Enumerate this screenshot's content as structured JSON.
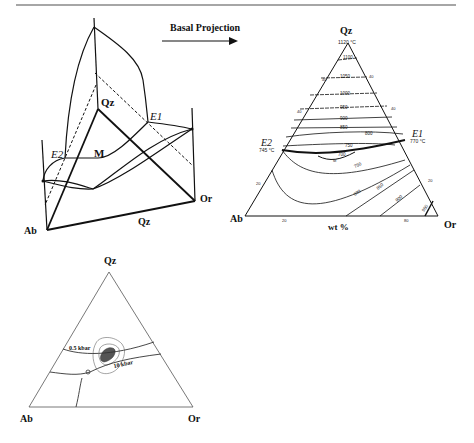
{
  "figure": {
    "top_rule": true,
    "block_diagram": {
      "labels": {
        "apex": "Qz",
        "left_corner": "Ab",
        "right_corner": "Or",
        "base_edge": "Qz",
        "eutectic_left": "E2",
        "eutectic_right": "E1",
        "minimum": "M"
      }
    },
    "arrow": {
      "label": "Basal Projection"
    },
    "projection": {
      "labels": {
        "apex": "Qz",
        "left_corner": "Ab",
        "right_corner": "Or",
        "axis": "wt %",
        "apex_temp": "1120 °C",
        "e2": "E2",
        "e2_temp": "745 °C",
        "e1": "E1",
        "e1_temp": "770 °C",
        "minimum": "M"
      },
      "isotherms": [
        "1100",
        "1050",
        "1000",
        "950",
        "900",
        "850",
        "800",
        "750",
        "700",
        "750",
        "800",
        "850",
        "900",
        "950"
      ],
      "edge_ticks": {
        "left_edge": [
          "40",
          "40",
          "20"
        ],
        "right_edge": [
          "40",
          "40",
          "20"
        ],
        "base": [
          "20",
          "80"
        ]
      }
    },
    "lower_ternary": {
      "labels": {
        "apex": "Qz",
        "left_corner": "Ab",
        "right_corner": "Or",
        "pressure_low": "0.5 kbar",
        "pressure_high": "10 kbar"
      }
    }
  }
}
